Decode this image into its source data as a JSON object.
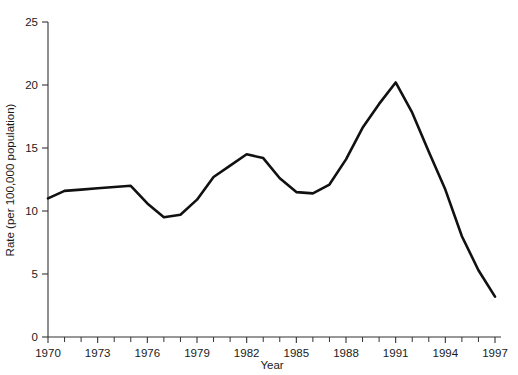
{
  "chart_data": {
    "type": "line",
    "title": "",
    "xlabel": "Year",
    "ylabel": "Rate (per 100,000 population)",
    "xlim": [
      1970,
      1997
    ],
    "ylim": [
      0,
      25
    ],
    "grid": false,
    "legend": false,
    "x_major_ticks": [
      1970,
      1973,
      1976,
      1979,
      1982,
      1985,
      1988,
      1991,
      1994,
      1997
    ],
    "x_major_tick_labels": [
      "1970",
      "1973",
      "1976",
      "1979",
      "1982",
      "1985",
      "1988",
      "1991",
      "1994",
      "1997"
    ],
    "x_minor_tick_interval": 1,
    "y_major_ticks": [
      0,
      5,
      10,
      15,
      20,
      25
    ],
    "y_major_tick_labels": [
      "0",
      "5",
      "10",
      "15",
      "20",
      "25"
    ],
    "line_color": "#111111",
    "line_width": 2.6,
    "x": [
      1970,
      1971,
      1972,
      1973,
      1974,
      1975,
      1976,
      1977,
      1978,
      1979,
      1980,
      1981,
      1982,
      1983,
      1984,
      1985,
      1986,
      1987,
      1988,
      1989,
      1990,
      1991,
      1992,
      1993,
      1994,
      1995,
      1996,
      1997
    ],
    "values": [
      11.0,
      11.6,
      11.7,
      11.8,
      11.9,
      12.0,
      10.6,
      9.5,
      9.7,
      10.9,
      12.7,
      13.6,
      14.5,
      14.2,
      12.6,
      11.5,
      11.4,
      12.1,
      14.1,
      16.6,
      18.5,
      20.2,
      17.8,
      14.7,
      11.7,
      8.0,
      5.3,
      3.2
    ],
    "series": [
      {
        "name": "Rate",
        "values": [
          11.0,
          11.6,
          11.7,
          11.8,
          11.9,
          12.0,
          10.6,
          9.5,
          9.7,
          10.9,
          12.7,
          13.6,
          14.5,
          14.2,
          12.6,
          11.5,
          11.4,
          12.1,
          14.1,
          16.6,
          18.5,
          20.2,
          17.8,
          14.7,
          11.7,
          8.0,
          5.3,
          3.2
        ]
      }
    ]
  },
  "axes": {
    "x_title": "Year",
    "y_title": "Rate (per 100,000 population)"
  }
}
